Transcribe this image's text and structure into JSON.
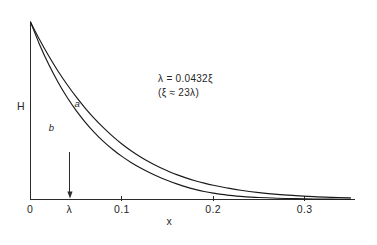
{
  "chart_data": {
    "type": "line",
    "title": "",
    "subtitle": "",
    "xlabel": "x",
    "ylabel": "H",
    "xlim": [
      0,
      0.355
    ],
    "ylim": [
      0,
      1.0
    ],
    "grid": false,
    "legend_position": "inline-curve-labels",
    "x_ticks": [
      {
        "value": 0,
        "label": "0"
      },
      {
        "value": 0.0432,
        "label": "λ"
      },
      {
        "value": 0.1,
        "label": "0.1"
      },
      {
        "value": 0.2,
        "label": "0.2"
      },
      {
        "value": 0.3,
        "label": "0.3"
      }
    ],
    "y_ticks": [],
    "annotations": [
      {
        "name": "lambda-relation",
        "line1": "λ = 0.0432ξ",
        "line2": "(ξ ≈ 23λ)"
      },
      {
        "name": "lambda-arrow",
        "x": 0.0432,
        "label": "λ",
        "direction": "down"
      }
    ],
    "series": [
      {
        "name": "a",
        "label": "a",
        "x": [
          0.0,
          0.01,
          0.02,
          0.03,
          0.04,
          0.05,
          0.06,
          0.07,
          0.08,
          0.09,
          0.1,
          0.11,
          0.12,
          0.13,
          0.14,
          0.15,
          0.16,
          0.17,
          0.18,
          0.19,
          0.2,
          0.215,
          0.23,
          0.25,
          0.27,
          0.29,
          0.31,
          0.33,
          0.35
        ],
        "y": [
          1.0,
          0.9,
          0.808,
          0.724,
          0.648,
          0.578,
          0.514,
          0.456,
          0.404,
          0.356,
          0.313,
          0.275,
          0.241,
          0.211,
          0.184,
          0.161,
          0.14,
          0.122,
          0.106,
          0.092,
          0.08,
          0.065,
          0.052,
          0.039,
          0.029,
          0.022,
          0.016,
          0.012,
          0.009
        ]
      },
      {
        "name": "b",
        "label": "b",
        "x": [
          0.0,
          0.01,
          0.02,
          0.03,
          0.04,
          0.05,
          0.06,
          0.07,
          0.08,
          0.09,
          0.1,
          0.11,
          0.12,
          0.13,
          0.14,
          0.15,
          0.16,
          0.17,
          0.18,
          0.19,
          0.2,
          0.215,
          0.23,
          0.25,
          0.27,
          0.29,
          0.31,
          0.33,
          0.35
        ],
        "y": [
          1.0,
          0.872,
          0.76,
          0.662,
          0.576,
          0.501,
          0.435,
          0.377,
          0.326,
          0.282,
          0.243,
          0.209,
          0.179,
          0.152,
          0.128,
          0.107,
          0.088,
          0.071,
          0.057,
          0.045,
          0.036,
          0.025,
          0.018,
          0.011,
          0.007,
          0.005,
          0.003,
          0.002,
          0.001
        ]
      }
    ]
  },
  "figure": {
    "axis_label_y": "H",
    "axis_label_x": "x",
    "curve_label_a": "a",
    "curve_label_b": "b",
    "lambda_tick_label": "λ",
    "origin_label": "0",
    "tick_0_1": "0.1",
    "tick_0_2": "0.2",
    "tick_0_3": "0.3",
    "annotation_line_1": "λ = 0.0432ξ",
    "annotation_line_2": "(ξ ≈ 23λ)"
  },
  "colors": {
    "ink": "#1a1a1a",
    "axis": "#2b2b2b",
    "background": "#ffffff"
  }
}
